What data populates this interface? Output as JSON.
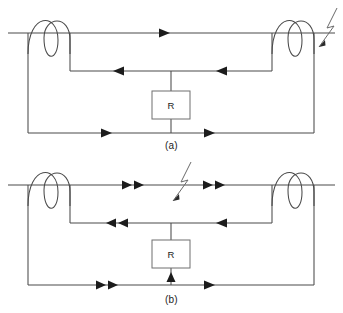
{
  "figure": {
    "background_color": "#ffffff",
    "wire_color": "#4a4a4a",
    "arrow_color": "#1c1c1c",
    "surge_color": "#6a6a6a",
    "resistor_border_color": "#6f6f6f"
  },
  "diagrams": [
    {
      "id": "a",
      "caption": "(a)",
      "surge_symbol": {
        "name": "lightning-surge-arrow",
        "position": "right-end-of-top-line",
        "direction": "down-left"
      },
      "components": [
        {
          "name": "left-coil",
          "type": "coil",
          "turns": 2,
          "label": ""
        },
        {
          "name": "right-coil",
          "type": "coil",
          "turns": 2,
          "label": ""
        },
        {
          "name": "resistor",
          "type": "resistor",
          "label": "R"
        }
      ],
      "current_arrows": [
        {
          "name": "top-line-arrow",
          "direction": "right",
          "count": 1
        },
        {
          "name": "middle-line-left-arrow",
          "direction": "left",
          "count": 1
        },
        {
          "name": "middle-line-right-arrow",
          "direction": "left",
          "count": 1
        },
        {
          "name": "bottom-line-left-arrow",
          "direction": "right",
          "count": 1
        },
        {
          "name": "bottom-line-right-arrow",
          "direction": "right",
          "count": 1
        }
      ]
    },
    {
      "id": "b",
      "caption": "(b)",
      "surge_symbol": {
        "name": "lightning-surge-arrow",
        "position": "middle-of-top-line",
        "direction": "down-left"
      },
      "components": [
        {
          "name": "left-coil",
          "type": "coil",
          "turns": 2,
          "label": ""
        },
        {
          "name": "right-coil",
          "type": "coil",
          "turns": 2,
          "label": ""
        },
        {
          "name": "resistor",
          "type": "resistor",
          "label": "R"
        }
      ],
      "current_arrows": [
        {
          "name": "top-line-left-arrows",
          "direction": "right",
          "count": 2
        },
        {
          "name": "top-line-right-arrows",
          "direction": "right",
          "count": 2
        },
        {
          "name": "middle-line-left-arrows",
          "direction": "left",
          "count": 2
        },
        {
          "name": "middle-line-right-arrow",
          "direction": "left",
          "count": 1
        },
        {
          "name": "bottom-line-left-arrows",
          "direction": "right",
          "count": 2
        },
        {
          "name": "resistor-lead-arrow",
          "direction": "up",
          "count": 1
        },
        {
          "name": "bottom-line-right-arrow",
          "direction": "right",
          "count": 1
        }
      ]
    }
  ],
  "labels": {
    "resistor_a": "R",
    "resistor_b": "R",
    "caption_a": "(a)",
    "caption_b": "(b)"
  }
}
